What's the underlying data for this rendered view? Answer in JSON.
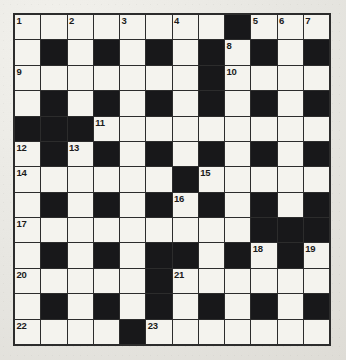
{
  "puzzle": {
    "kind": "crossword-grid",
    "columns": 12,
    "rows": 13,
    "colors": {
      "paper": "#e8e7e2",
      "cell_white": "#f4f3ee",
      "cell_black": "#18181a",
      "grid_line": "#2c2c2c",
      "number_text": "#1b1b1b"
    },
    "numbers_visible": [
      "1",
      "2",
      "3",
      "4",
      "5",
      "6",
      "7",
      "8",
      "9",
      "10",
      "11",
      "12",
      "13",
      "14",
      "15",
      "16",
      "17",
      "18",
      "19",
      "20",
      "21",
      "22",
      "23"
    ],
    "grid": [
      [
        "W",
        "W",
        "W",
        "W",
        "W",
        "W",
        "W",
        "W",
        "B",
        "W",
        "W",
        "W"
      ],
      [
        "W",
        "B",
        "W",
        "B",
        "W",
        "B",
        "W",
        "B",
        "W",
        "B",
        "W",
        "B"
      ],
      [
        "W",
        "W",
        "W",
        "W",
        "W",
        "W",
        "W",
        "B",
        "W",
        "W",
        "W",
        "W"
      ],
      [
        "W",
        "B",
        "W",
        "B",
        "W",
        "B",
        "W",
        "B",
        "W",
        "B",
        "W",
        "B"
      ],
      [
        "B",
        "B",
        "B",
        "W",
        "W",
        "W",
        "W",
        "W",
        "W",
        "W",
        "W",
        "W"
      ],
      [
        "W",
        "B",
        "W",
        "B",
        "W",
        "B",
        "W",
        "B",
        "W",
        "B",
        "W",
        "B"
      ],
      [
        "W",
        "W",
        "W",
        "W",
        "W",
        "W",
        "B",
        "W",
        "W",
        "W",
        "W",
        "W"
      ],
      [
        "W",
        "B",
        "W",
        "B",
        "W",
        "B",
        "W",
        "B",
        "W",
        "B",
        "W",
        "B"
      ],
      [
        "W",
        "W",
        "W",
        "W",
        "W",
        "W",
        "W",
        "W",
        "W",
        "B",
        "B",
        "B"
      ],
      [
        "W",
        "B",
        "W",
        "B",
        "W",
        "B",
        "B",
        "W",
        "B",
        "W",
        "B",
        "W"
      ],
      [
        "W",
        "W",
        "W",
        "W",
        "W",
        "B",
        "W",
        "W",
        "W",
        "W",
        "W",
        "W"
      ],
      [
        "W",
        "B",
        "W",
        "B",
        "W",
        "B",
        "W",
        "B",
        "W",
        "B",
        "W",
        "B"
      ],
      [
        "W",
        "W",
        "W",
        "W",
        "B",
        "W",
        "W",
        "W",
        "W",
        "W",
        "W",
        "W"
      ]
    ],
    "clue_numbers": [
      {
        "row": 0,
        "col": 0,
        "n": "1"
      },
      {
        "row": 0,
        "col": 2,
        "n": "2"
      },
      {
        "row": 0,
        "col": 4,
        "n": "3"
      },
      {
        "row": 0,
        "col": 6,
        "n": "4"
      },
      {
        "row": 0,
        "col": 9,
        "n": "5"
      },
      {
        "row": 0,
        "col": 10,
        "n": "6"
      },
      {
        "row": 1,
        "col": 8,
        "n": "8"
      },
      {
        "row": 0,
        "col": 11,
        "n": "7"
      },
      {
        "row": 2,
        "col": 0,
        "n": "9"
      },
      {
        "row": 2,
        "col": 8,
        "n": "10"
      },
      {
        "row": 4,
        "col": 3,
        "n": "11"
      },
      {
        "row": 5,
        "col": 0,
        "n": "12"
      },
      {
        "row": 5,
        "col": 2,
        "n": "13"
      },
      {
        "row": 6,
        "col": 0,
        "n": "14"
      },
      {
        "row": 6,
        "col": 7,
        "n": "15"
      },
      {
        "row": 7,
        "col": 6,
        "n": "16"
      },
      {
        "row": 8,
        "col": 0,
        "n": "17"
      },
      {
        "row": 9,
        "col": 9,
        "n": "18"
      },
      {
        "row": 9,
        "col": 11,
        "n": "19"
      },
      {
        "row": 10,
        "col": 0,
        "n": "20"
      },
      {
        "row": 10,
        "col": 6,
        "n": "21"
      },
      {
        "row": 12,
        "col": 0,
        "n": "22"
      },
      {
        "row": 12,
        "col": 5,
        "n": "23"
      }
    ]
  }
}
